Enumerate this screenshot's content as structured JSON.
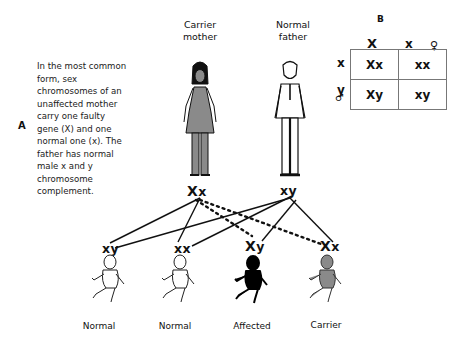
{
  "description": {
    "panel_label": "A",
    "text": "In the most common form, sex chromosomes of an unaffected mother carry one faulty gene (X) and one normal one (x). The father has normal male x and y chromosome complement."
  },
  "parents": {
    "mother": {
      "label_line1": "Carrier",
      "label_line2": "mother",
      "genotype_big": "X",
      "genotype_small": "x"
    },
    "father": {
      "label_line1": "Normal",
      "label_line2": "father",
      "genotype": "xy"
    }
  },
  "children": [
    {
      "genotype_big": "",
      "genotype": "xy",
      "label": "Normal",
      "fill": "white"
    },
    {
      "genotype_big": "",
      "genotype": "xx",
      "label": "Normal",
      "fill": "white"
    },
    {
      "genotype_big": "X",
      "genotype": "y",
      "label": "Affected",
      "fill": "#000000"
    },
    {
      "genotype_big": "X",
      "genotype": "x",
      "label": "Carrier",
      "fill": "#8a8a8a"
    }
  ],
  "punnett": {
    "panel_label": "B",
    "female_symbol": "♀",
    "male_symbol": "♂",
    "col_headers": [
      "X",
      "x"
    ],
    "row_headers": [
      "x",
      "y"
    ],
    "cells": [
      [
        "Xx",
        "xx"
      ],
      [
        "Xy",
        "xy"
      ]
    ]
  },
  "colors": {
    "mother_dress": "#8a8a8a",
    "affected": "#000000",
    "carrier": "#8a8a8a"
  }
}
